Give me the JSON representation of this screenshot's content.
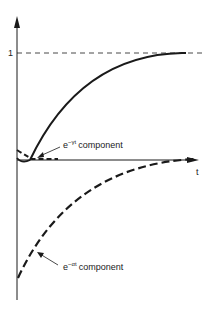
{
  "diagram": {
    "y_axis": {
      "tick_label": "1"
    },
    "x_axis": {
      "label": "t"
    },
    "curves": [
      {
        "name": "total-response",
        "style": "solid",
        "description": "rises from 0 toward asymptote 1"
      },
      {
        "name": "gamma-component",
        "style": "dashed",
        "label_base": "e",
        "label_exp": "−γt",
        "label_text": "component"
      },
      {
        "name": "alpha-component",
        "style": "dashed",
        "label_base": "e",
        "label_exp": "−αt",
        "label_text": "component"
      }
    ],
    "asymptote": {
      "value": "1",
      "style": "dashed"
    }
  },
  "colors": {
    "ink": "#1a1a1a",
    "background": "#ffffff"
  }
}
